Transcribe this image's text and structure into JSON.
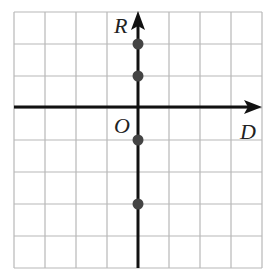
{
  "diagram": {
    "type": "coordinate-grid",
    "grid": {
      "columns": 8,
      "rows": 8,
      "color": "#b8b8b8"
    },
    "axes": {
      "horizontal_label": "D",
      "vertical_label": "R",
      "origin_label": "O",
      "color": "#111111"
    },
    "points": [
      {
        "x": 0,
        "y": 2
      },
      {
        "x": 0,
        "y": 1
      },
      {
        "x": 0,
        "y": -1
      },
      {
        "x": 0,
        "y": -3
      }
    ],
    "point_color": "#444444"
  }
}
